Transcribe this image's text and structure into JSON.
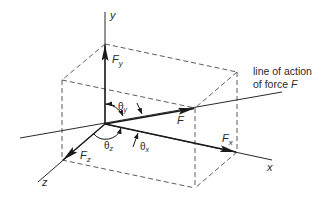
{
  "diagram": {
    "axes": {
      "x_label": "x",
      "y_label": "y",
      "z_label": "z"
    },
    "forces": {
      "resultant": "F",
      "fx": {
        "main": "F",
        "sub": "x"
      },
      "fy": {
        "main": "F",
        "sub": "y"
      },
      "fz": {
        "main": "F",
        "sub": "z"
      }
    },
    "angles": {
      "theta_x": {
        "main": "θ",
        "sub": "x"
      },
      "theta_y": {
        "main": "θ",
        "sub": "y"
      },
      "theta_z": {
        "main": "θ",
        "sub": "z"
      }
    },
    "annotation": {
      "line1": "line of action",
      "line2_prefix": "of force ",
      "line2_symbol": "F"
    },
    "colors": {
      "line": "#2a2a2a",
      "dashed": "#4a4a4a",
      "background": "#ffffff"
    }
  }
}
